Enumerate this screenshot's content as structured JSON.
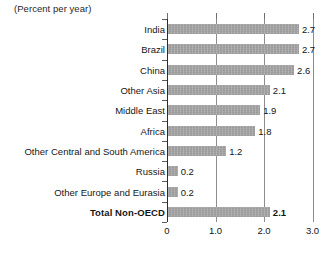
{
  "chart_data": {
    "type": "bar",
    "orientation": "horizontal",
    "title": "",
    "subtitle": "(Percent per year)",
    "xlabel": "",
    "ylabel": "",
    "xlim": [
      0,
      3.0
    ],
    "xticks": [
      "0",
      "1.0",
      "2.0",
      "3.0"
    ],
    "xtick_values": [
      0,
      1.0,
      2.0,
      3.0
    ],
    "grid": "vertical",
    "legend": "none",
    "categories": [
      "India",
      "Brazil",
      "China",
      "Other Asia",
      "Middle East",
      "Africa",
      "Other Central and South America",
      "Russia",
      "Other Europe and Eurasia",
      "Total Non-OECD"
    ],
    "values": [
      2.7,
      2.7,
      2.6,
      2.1,
      1.9,
      1.8,
      1.2,
      0.2,
      0.2,
      2.1
    ],
    "value_labels": [
      "2.7",
      "2.7",
      "2.6",
      "2.1",
      "1.9",
      "1.8",
      "1.2",
      "0.2",
      "0.2",
      "2.1"
    ],
    "emphasized": [
      false,
      false,
      false,
      false,
      false,
      false,
      false,
      false,
      false,
      true
    ],
    "colors": {
      "bar": "#a3a3a3",
      "axis": "#2b2b2b",
      "gridline": "#8d8d8d",
      "text": "#141414",
      "background": "#ffffff"
    }
  },
  "unit_note": "(Percent per year)"
}
